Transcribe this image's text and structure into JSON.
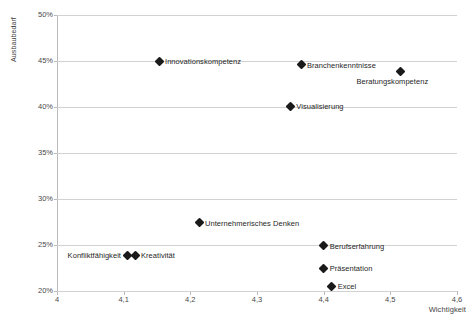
{
  "chart_data": {
    "type": "scatter",
    "title": "",
    "xlabel": "Wichtigkeit",
    "ylabel": "Ausbaubedarf",
    "xlim": [
      4,
      4.6
    ],
    "ylim": [
      20,
      50
    ],
    "grid": true,
    "legend": "none",
    "x_tick_labels": [
      "4",
      "4,1",
      "4,2",
      "4,3",
      "4,4",
      "4,5",
      "4,6"
    ],
    "x_tick_values": [
      4,
      4.1,
      4.2,
      4.3,
      4.4,
      4.5,
      4.6
    ],
    "y_tick_labels": [
      "20%",
      "25%",
      "30%",
      "35%",
      "40%",
      "45%",
      "50%"
    ],
    "y_tick_values": [
      20,
      25,
      30,
      35,
      40,
      45,
      50
    ],
    "points": [
      {
        "label": "Innovationskompetenz",
        "x": 4.153,
        "y": 45.0,
        "label_pos": "right"
      },
      {
        "label": "Branchenkenntnisse",
        "x": 4.366,
        "y": 44.6,
        "label_pos": "right"
      },
      {
        "label": "Beratungskompetenz",
        "x": 4.515,
        "y": 43.9,
        "label_pos": "below"
      },
      {
        "label": "Visualisierung",
        "x": 4.35,
        "y": 40.1,
        "label_pos": "right"
      },
      {
        "label": "Unternehmerisches Denken",
        "x": 4.213,
        "y": 27.4,
        "label_pos": "right"
      },
      {
        "label": "Berufserfahrung",
        "x": 4.4,
        "y": 24.9,
        "label_pos": "right"
      },
      {
        "label": "Konfliktfähigkeit",
        "x": 4.105,
        "y": 23.9,
        "label_pos": "left"
      },
      {
        "label": "Kreativität",
        "x": 4.117,
        "y": 23.9,
        "label_pos": "right"
      },
      {
        "label": "Präsentation",
        "x": 4.4,
        "y": 22.5,
        "label_pos": "right"
      },
      {
        "label": "Excel",
        "x": 4.412,
        "y": 20.5,
        "label_pos": "right"
      }
    ]
  },
  "colors": {
    "marker": "#1a1a1a",
    "gridline": "#d2d2d2",
    "axis": "#b9b9b9",
    "text": "#3a3a3a",
    "background": "#ffffff"
  }
}
